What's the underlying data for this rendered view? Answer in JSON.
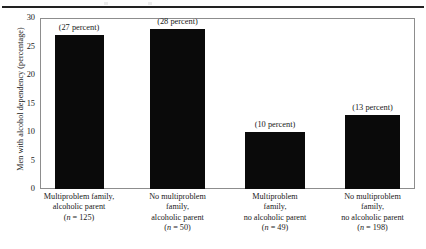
{
  "chart_data": {
    "type": "bar",
    "title": "",
    "subtitle": "",
    "xlabel": "",
    "ylabel": "Men with alcohol dependency (percentage)",
    "ylim": [
      0,
      30
    ],
    "yticks": [
      0,
      5,
      10,
      15,
      20,
      25,
      30
    ],
    "ytick_labels": [
      "0",
      "5",
      "10",
      "15",
      "20",
      "25",
      "30"
    ],
    "grid": false,
    "legend": false,
    "bar_color": "#0a0a0a",
    "categories": [
      "Multiproblem family, alcoholic parent",
      "No multiproblem family, alcoholic parent",
      "Multiproblem family, no alcoholic parent",
      "No multiproblem family, no alcoholic parent"
    ],
    "values": [
      27,
      28,
      10,
      13
    ],
    "data_labels": [
      "(27 percent)",
      "(28 percent)",
      "(10 percent)",
      "(13 percent)"
    ],
    "group_sizes": [
      125,
      50,
      49,
      198
    ],
    "category_lines": [
      [
        "Multiproblem family,",
        "alcoholic parent"
      ],
      [
        "No multiproblem",
        "family,",
        "alcoholic parent"
      ],
      [
        "Multiproblem",
        "family,",
        "no alcoholic parent"
      ],
      [
        "No multiproblem",
        "family,",
        "no alcoholic parent"
      ]
    ],
    "n_labels": [
      "(n = 125)",
      "(n = 50)",
      "(n = 49)",
      "(n = 198)"
    ]
  }
}
